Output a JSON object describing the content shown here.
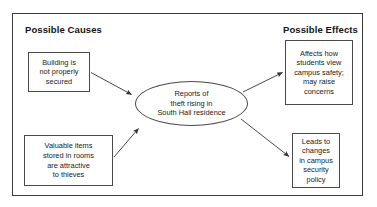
{
  "diagram": {
    "title_left": "Possible Causes",
    "title_right": "Possible Effects",
    "center": {
      "id": "central-event",
      "text": "Reports of\ntheft rising in\nSouth Hall residence",
      "shape": "ellipse"
    },
    "causes": [
      {
        "id": "cause-1",
        "text": "Building is\nnot properly\nsecured"
      },
      {
        "id": "cause-2",
        "text": "Valuable items\nstored in rooms\nare attractive\nto thieves"
      }
    ],
    "effects": [
      {
        "id": "effect-1",
        "text": "Affects how\nstudents view\ncampus safety;\nmay raise\nconcerns"
      },
      {
        "id": "effect-2",
        "text": "Leads to\nchanges\nin campus\nsecurity\npolicy"
      }
    ],
    "arrows": [
      {
        "id": "arrow-cause1-to-center",
        "from": "cause-1",
        "to": "central-event",
        "direction": "right-down"
      },
      {
        "id": "arrow-cause2-to-center",
        "from": "cause-2",
        "to": "central-event",
        "direction": "right-up"
      },
      {
        "id": "arrow-center-to-effect1",
        "from": "central-event",
        "to": "effect-1",
        "direction": "right-up"
      },
      {
        "id": "arrow-center-to-effect2",
        "from": "central-event",
        "to": "effect-2",
        "direction": "right-down"
      }
    ],
    "colors": {
      "frame": "#3a3a3a",
      "node_border": "#4a4a4a",
      "text": "#1a1a1a",
      "background": "#ffffff",
      "arrow": "#333333"
    }
  }
}
